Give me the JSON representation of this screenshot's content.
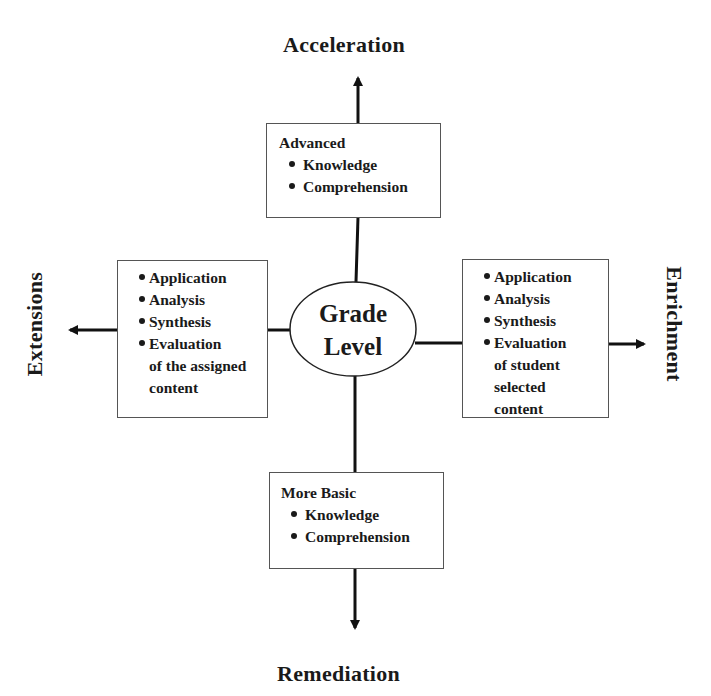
{
  "directions": {
    "top": "Acceleration",
    "bottom": "Remediation",
    "left": "Extensions",
    "right": "Enrichment"
  },
  "center": {
    "line1": "Grade",
    "line2": "Level"
  },
  "boxes": {
    "top": {
      "heading": "Advanced",
      "items": [
        "Knowledge",
        "Comprehension"
      ]
    },
    "bottom": {
      "heading": "More Basic",
      "items": [
        "Knowledge",
        "Comprehension"
      ]
    },
    "left": {
      "items": [
        "Application",
        "Analysis",
        "Synthesis",
        "Evaluation"
      ],
      "continuation": [
        "of the assigned",
        "content"
      ]
    },
    "right": {
      "items": [
        "Application",
        "Analysis",
        "Synthesis",
        "Evaluation"
      ],
      "continuation": [
        "of student",
        "selected",
        "content"
      ]
    }
  }
}
